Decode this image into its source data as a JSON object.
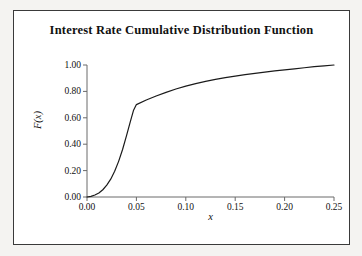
{
  "chart_data": {
    "type": "line",
    "title": "Interest Rate Cumulative Distribution Function",
    "xlabel": "x",
    "ylabel": "F(x)",
    "xlim": [
      0.0,
      0.25
    ],
    "ylim": [
      0.0,
      1.0
    ],
    "grid": false,
    "legend": null,
    "xticks": [
      "0.00",
      "0.05",
      "0.10",
      "0.15",
      "0.20",
      "0.25"
    ],
    "xtick_values": [
      0.0,
      0.05,
      0.1,
      0.15,
      0.2,
      0.25
    ],
    "yticks": [
      "0.00",
      "0.20",
      "0.40",
      "0.60",
      "0.80",
      "1.00"
    ],
    "ytick_values": [
      0.0,
      0.2,
      0.4,
      0.6,
      0.8,
      1.0
    ],
    "series": [
      {
        "name": "F(x)",
        "color": "#1a1a1a",
        "x": [
          0.0,
          0.004,
          0.008,
          0.012,
          0.016,
          0.02,
          0.024,
          0.028,
          0.032,
          0.036,
          0.04,
          0.044,
          0.047,
          0.05,
          0.06,
          0.07,
          0.08,
          0.09,
          0.1,
          0.11,
          0.12,
          0.13,
          0.14,
          0.15,
          0.16,
          0.17,
          0.18,
          0.19,
          0.2,
          0.21,
          0.22,
          0.23,
          0.24,
          0.25
        ],
        "y": [
          0.0,
          0.005,
          0.015,
          0.03,
          0.055,
          0.09,
          0.135,
          0.195,
          0.27,
          0.36,
          0.465,
          0.575,
          0.655,
          0.7,
          0.735,
          0.765,
          0.793,
          0.818,
          0.84,
          0.859,
          0.876,
          0.891,
          0.904,
          0.916,
          0.927,
          0.937,
          0.946,
          0.955,
          0.963,
          0.971,
          0.979,
          0.987,
          0.994,
          1.0
        ]
      }
    ],
    "annotations": [
      {
        "label": "kink",
        "x": 0.05,
        "y": 0.7
      }
    ]
  }
}
